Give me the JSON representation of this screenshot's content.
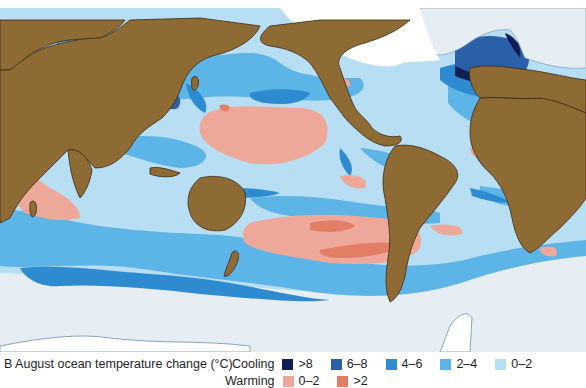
{
  "figure": {
    "label": "B",
    "caption": "B  August ocean temperature change (°C)"
  },
  "map": {
    "colors": {
      "land": "#8e6b34",
      "coast": "#3a2a14",
      "ice": "#ffffff",
      "sea_ice": "#e6edf3",
      "cool_gt8": "#0f1e55",
      "cool_6_8": "#2b5fa8",
      "cool_4_6": "#2f8bd0",
      "cool_2_4": "#5db4e6",
      "cool_0_2": "#b8def3",
      "warm_0_2": "#eda89a",
      "warm_gt2": "#e27e66",
      "warm_hot": "#c0341c"
    }
  },
  "legend": {
    "cooling_label": "Cooling",
    "warming_label": "Warming",
    "cooling": [
      {
        "label": ">8",
        "color": "#0f1e55"
      },
      {
        "label": "6–8",
        "color": "#2b5fa8"
      },
      {
        "label": "4–6",
        "color": "#2f8bd0"
      },
      {
        "label": "2–4",
        "color": "#5db4e6"
      },
      {
        "label": "0–2",
        "color": "#b8def3"
      }
    ],
    "warming": [
      {
        "label": "0–2",
        "color": "#eda89a"
      },
      {
        "label": ">2",
        "color": "#e27e66"
      }
    ]
  }
}
